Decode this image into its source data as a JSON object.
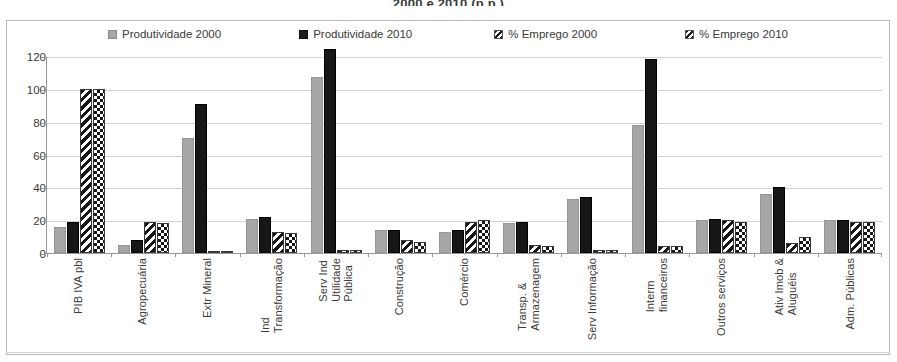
{
  "chart": {
    "title": "2000 e 2010 (p.p.)"
  },
  "legend": {
    "position": "top",
    "items": [
      {
        "label": "Produtividade 2000",
        "swatch": "solid-gray-square-icon",
        "color": "#a6a6a6"
      },
      {
        "label": "Produtividade 2010",
        "swatch": "solid-black-square-icon",
        "color": "#1d1d1d"
      },
      {
        "label": "% Emprego 2000",
        "swatch": "diagonal-hatch-square-icon",
        "color": "#1d1d1d"
      },
      {
        "label": "% Emprego 2010",
        "swatch": "checker-hatch-square-icon",
        "color": "#1d1d1d"
      }
    ]
  },
  "chart_data": {
    "type": "bar",
    "title": "2000 e 2010 (p.p.)",
    "xlabel": "",
    "ylabel": "",
    "ylim": [
      0,
      120
    ],
    "yticks": [
      0,
      20,
      40,
      60,
      80,
      100,
      120
    ],
    "grid": true,
    "legend_position": "top",
    "categories": [
      "PIB IVA pbl",
      "Agropecuária",
      "Extr Mineral",
      "Ind\nTransformação",
      "Serv Ind\nUtilidade\nPública",
      "Construção",
      "Comércio",
      "Transp. &\nArmazenagem",
      "Serv Informação",
      "Interm\nfinanceiros",
      "Outros serviços",
      "Ativ Imob &\nAluguéis",
      "Adm. Públicas"
    ],
    "series": [
      {
        "name": "Produtividade 2000",
        "values": [
          16,
          5,
          70,
          21,
          107,
          14,
          13,
          18,
          33,
          78,
          20,
          36,
          20
        ]
      },
      {
        "name": "Produtividade 2010",
        "values": [
          19,
          8,
          91,
          22,
          124,
          14,
          14,
          19,
          34,
          118,
          21,
          40,
          20
        ]
      },
      {
        "name": "% Emprego 2000",
        "values": [
          100,
          19,
          1,
          13,
          2,
          8,
          19,
          5,
          2,
          4,
          20,
          6,
          19
        ]
      },
      {
        "name": "% Emprego 2010",
        "values": [
          100,
          18,
          1,
          12,
          2,
          7,
          20,
          4,
          2,
          4,
          19,
          10,
          19
        ]
      }
    ]
  }
}
